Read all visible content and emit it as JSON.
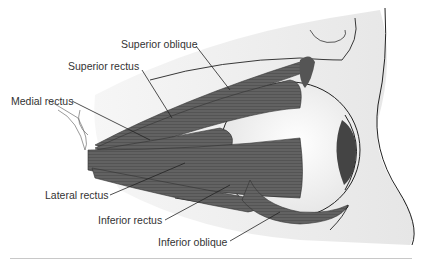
{
  "figure": {
    "labels": [
      {
        "id": "superior-oblique",
        "text": "Superior oblique"
      },
      {
        "id": "superior-rectus",
        "text": "Superior rectus"
      },
      {
        "id": "medial-rectus",
        "text": "Medial rectus"
      },
      {
        "id": "lateral-rectus",
        "text": "Lateral rectus"
      },
      {
        "id": "inferior-rectus",
        "text": "Inferior rectus"
      },
      {
        "id": "inferior-oblique",
        "text": "Inferior oblique"
      }
    ]
  },
  "colors": {
    "muscle": "#5f5f5f",
    "muscle_dark": "#3a3a3a",
    "outline": "#222222",
    "skin_shade": "#ececec",
    "text": "#333333"
  }
}
